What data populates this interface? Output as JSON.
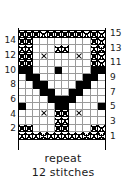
{
  "chart_data": {
    "type": "heatmap",
    "title": "",
    "xlabel": "12 stitches",
    "ylabel": "",
    "grid": true,
    "legend_position": "none",
    "stitches": 12,
    "rows": 15,
    "symbols": {
      "blank": "knit / plain stitch (white cell)",
      "fill": "solid filled stitch (black cell)",
      "tex": "textured seed-stitch (cross-hatch dotted cell)",
      "cross": "crossed / cable stitch (X symbol)"
    },
    "row_labels_left": [
      "",
      "14",
      "",
      "12",
      "",
      "10",
      "",
      "8",
      "",
      "6",
      "",
      "4",
      "",
      "2",
      ""
    ],
    "row_labels_right": [
      "15",
      "",
      "13",
      "",
      "11",
      "",
      "9",
      "",
      "7",
      "",
      "5",
      "",
      "3",
      "",
      "1"
    ],
    "cells": [
      [
        "tex",
        "tex",
        "tex",
        "tex",
        "tex",
        "tex",
        "tex",
        "tex",
        "tex",
        "tex",
        "tex",
        "tex"
      ],
      [
        "tex",
        "tex",
        "blank",
        "blank",
        "blank",
        "blank",
        "blank",
        "blank",
        "blank",
        "blank",
        "tex",
        "tex"
      ],
      [
        "tex",
        "tex",
        "blank",
        "blank",
        "blank",
        "tex",
        "tex",
        "blank",
        "blank",
        "blank",
        "tex",
        "tex"
      ],
      [
        "tex",
        "tex",
        "blank",
        "cross",
        "blank",
        "blank",
        "blank",
        "blank",
        "cross",
        "blank",
        "tex",
        "tex"
      ],
      [
        "tex",
        "tex",
        "blank",
        "blank",
        "blank",
        "blank",
        "blank",
        "blank",
        "blank",
        "blank",
        "tex",
        "tex"
      ],
      [
        "fill",
        "fill",
        "blank",
        "blank",
        "blank",
        "fill",
        "blank",
        "blank",
        "blank",
        "blank",
        "fill",
        "fill"
      ],
      [
        "blank",
        "fill",
        "fill",
        "blank",
        "blank",
        "blank",
        "blank",
        "blank",
        "blank",
        "fill",
        "fill",
        "blank"
      ],
      [
        "blank",
        "blank",
        "fill",
        "fill",
        "blank",
        "blank",
        "blank",
        "blank",
        "fill",
        "fill",
        "blank",
        "blank"
      ],
      [
        "blank",
        "blank",
        "blank",
        "fill",
        "fill",
        "blank",
        "blank",
        "fill",
        "fill",
        "blank",
        "blank",
        "blank"
      ],
      [
        "blank",
        "blank",
        "blank",
        "blank",
        "fill",
        "fill",
        "fill",
        "fill",
        "blank",
        "blank",
        "blank",
        "blank"
      ],
      [
        "fill",
        "blank",
        "blank",
        "blank",
        "blank",
        "fill",
        "fill",
        "blank",
        "blank",
        "blank",
        "blank",
        "fill"
      ],
      [
        "blank",
        "blank",
        "blank",
        "cross",
        "blank",
        "tex",
        "tex",
        "blank",
        "cross",
        "blank",
        "blank",
        "blank"
      ],
      [
        "blank",
        "blank",
        "blank",
        "blank",
        "blank",
        "tex",
        "tex",
        "blank",
        "blank",
        "blank",
        "blank",
        "blank"
      ],
      [
        "tex",
        "tex",
        "blank",
        "blank",
        "blank",
        "tex",
        "tex",
        "blank",
        "blank",
        "blank",
        "tex",
        "tex"
      ],
      [
        "tex",
        "tex",
        "tex",
        "tex",
        "tex",
        "tex",
        "tex",
        "tex",
        "tex",
        "tex",
        "tex",
        "tex"
      ]
    ]
  },
  "caption": {
    "line1": "repeat",
    "line2": "12 stitches"
  },
  "colors": {
    "fill": "#000000",
    "blank": "#ffffff",
    "gridline": "#9a9a9a",
    "border": "#000000"
  }
}
